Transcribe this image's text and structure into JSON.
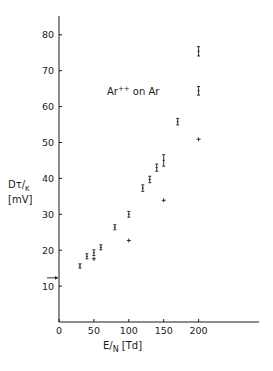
{
  "chart_data": {
    "type": "scatter",
    "title": "",
    "annotation": "Ar++ on Ar",
    "xlabel": "E/N [Td]",
    "ylabel": "Dτ/K [mV]",
    "xlim": [
      0,
      290
    ],
    "ylim": [
      0,
      85
    ],
    "xticks": [
      0,
      50,
      100,
      150,
      200
    ],
    "yticks": [
      10,
      20,
      30,
      40,
      50,
      60,
      70,
      80
    ],
    "grid": false,
    "legend_position": "none",
    "arrow_marker": {
      "x": 0,
      "y": 12.3,
      "note": "arrow pointing to y-axis"
    },
    "series": [
      {
        "name": "measured (error bars)",
        "marker": "I-bar",
        "points": [
          {
            "x": 30,
            "y": 15.6,
            "err": 0.6
          },
          {
            "x": 40,
            "y": 18.3,
            "err": 0.7
          },
          {
            "x": 50,
            "y": 19.3,
            "err": 0.8
          },
          {
            "x": 60,
            "y": 20.8,
            "err": 0.7
          },
          {
            "x": 80,
            "y": 26.4,
            "err": 0.7
          },
          {
            "x": 100,
            "y": 30.0,
            "err": 0.8
          },
          {
            "x": 120,
            "y": 37.3,
            "err": 0.9
          },
          {
            "x": 130,
            "y": 39.7,
            "err": 0.9
          },
          {
            "x": 140,
            "y": 43.0,
            "err": 1.0
          },
          {
            "x": 150,
            "y": 45.0,
            "err": 1.6
          },
          {
            "x": 170,
            "y": 55.8,
            "err": 0.9
          },
          {
            "x": 200,
            "y": 64.4,
            "err": 1.2
          },
          {
            "x": 200,
            "y": 75.4,
            "err": 1.3
          }
        ]
      },
      {
        "name": "calculated (crosses)",
        "marker": "+",
        "points": [
          {
            "x": 50,
            "y": 17.6
          },
          {
            "x": 100,
            "y": 22.7
          },
          {
            "x": 150,
            "y": 33.9
          },
          {
            "x": 200,
            "y": 50.9
          }
        ]
      }
    ]
  },
  "labels": {
    "ylabel_main": "Dτ/",
    "ylabel_sub": "K",
    "ylabel_unit": "[mV]",
    "xlabel_main": "E/",
    "xlabel_sub": "N",
    "xlabel_unit": " [Td]",
    "legend_a": "Ar",
    "legend_sup": "++",
    "legend_b": " on Ar"
  }
}
